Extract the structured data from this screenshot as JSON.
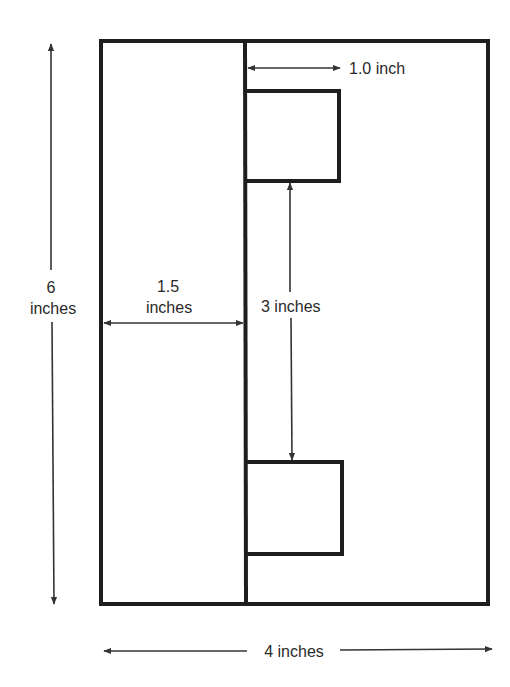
{
  "diagram": {
    "type": "dimensioned-layout-drawing",
    "colors": {
      "stroke": "#1e1e1e",
      "arrow": "#333333",
      "text": "#2a2a2a",
      "background": "#ffffff"
    },
    "outer_rectangle": {
      "width_in": 4,
      "height_in": 6
    },
    "labels": {
      "height_value": "6",
      "height_unit": "inches",
      "width_total": "4 inches",
      "left_panel_value": "1.5",
      "left_panel_unit": "inches",
      "box_width": "1.0 inch",
      "box_gap": "3 inches"
    },
    "dimensions": [
      {
        "name": "overall-height",
        "value": 6,
        "unit": "inches"
      },
      {
        "name": "overall-width",
        "value": 4,
        "unit": "inches"
      },
      {
        "name": "left-panel-width",
        "value": 1.5,
        "unit": "inches"
      },
      {
        "name": "small-box-width",
        "value": 1.0,
        "unit": "inch"
      },
      {
        "name": "gap-between-boxes",
        "value": 3,
        "unit": "inches"
      }
    ]
  }
}
